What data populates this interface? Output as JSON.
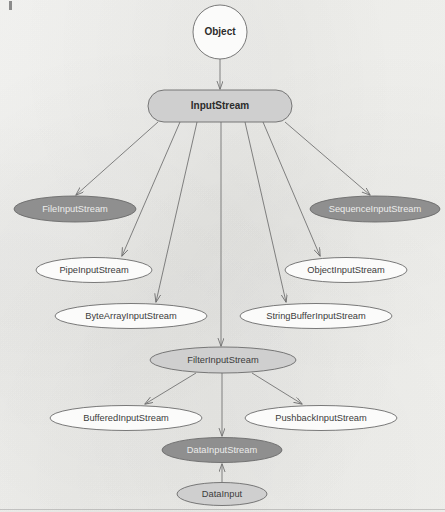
{
  "diagram": {
    "type": "class-hierarchy",
    "width": 445,
    "height": 512,
    "background_color": "#f4f4f1",
    "colors": {
      "dark_fill": "#8f8f8f",
      "light_fill": "#cfcfcf",
      "white_fill": "#fbfbfa",
      "stroke": "#6b6b6b",
      "edge": "#6d6d6d",
      "dark_text": "#3c3c3c",
      "light_text": "#ececeb"
    },
    "nodes": [
      {
        "id": "object",
        "label": "Object",
        "shape": "circle",
        "cx": 220,
        "cy": 32,
        "rx": 27,
        "ry": 27,
        "fill": "white",
        "text": "dark",
        "bold": true
      },
      {
        "id": "input-stream",
        "label": "InputStream",
        "shape": "stadium",
        "cx": 220,
        "cy": 106,
        "rx": 72,
        "ry": 16,
        "fill": "light",
        "text": "dark",
        "bold": true
      },
      {
        "id": "file-input-stream",
        "label": "FileInputStream",
        "shape": "ellipse",
        "cx": 75,
        "cy": 209,
        "rx": 61,
        "ry": 13,
        "fill": "dark",
        "text": "light",
        "bold": false
      },
      {
        "id": "sequence-input-stream",
        "label": "SequenceInputStream",
        "shape": "ellipse",
        "cx": 375,
        "cy": 209,
        "rx": 65,
        "ry": 13,
        "fill": "dark",
        "text": "light",
        "bold": false
      },
      {
        "id": "pipe-input-stream",
        "label": "PipeInputStream",
        "shape": "ellipse",
        "cx": 94,
        "cy": 270,
        "rx": 58,
        "ry": 12.5,
        "fill": "white",
        "text": "dark",
        "bold": false
      },
      {
        "id": "object-input-stream",
        "label": "ObjectInputStream",
        "shape": "ellipse",
        "cx": 346,
        "cy": 270,
        "rx": 61,
        "ry": 12.5,
        "fill": "white",
        "text": "dark",
        "bold": false
      },
      {
        "id": "byte-array-input-stream",
        "label": "ByteArrayInputStream",
        "shape": "ellipse",
        "cx": 131,
        "cy": 316,
        "rx": 76,
        "ry": 12.5,
        "fill": "white",
        "text": "dark",
        "bold": false
      },
      {
        "id": "string-buffer-input-stream",
        "label": "StringBufferInputStream",
        "shape": "ellipse",
        "cx": 316,
        "cy": 316,
        "rx": 76,
        "ry": 12.5,
        "fill": "white",
        "text": "dark",
        "bold": false
      },
      {
        "id": "filter-input-stream",
        "label": "FilterInputStream",
        "shape": "ellipse",
        "cx": 223,
        "cy": 360,
        "rx": 73,
        "ry": 13,
        "fill": "light",
        "text": "dark",
        "bold": false
      },
      {
        "id": "buffered-input-stream",
        "label": "BufferedInputStream",
        "shape": "ellipse",
        "cx": 126,
        "cy": 418,
        "rx": 76,
        "ry": 12.5,
        "fill": "white",
        "text": "dark",
        "bold": false
      },
      {
        "id": "pushback-input-stream",
        "label": "PushbackInputStream",
        "shape": "ellipse",
        "cx": 321,
        "cy": 418,
        "rx": 76,
        "ry": 12.5,
        "fill": "white",
        "text": "dark",
        "bold": false
      },
      {
        "id": "data-input-stream",
        "label": "DataInputStream",
        "shape": "ellipse",
        "cx": 222,
        "cy": 450,
        "rx": 60,
        "ry": 12.5,
        "fill": "dark",
        "text": "light",
        "bold": false
      },
      {
        "id": "data-input",
        "label": "DataInput",
        "shape": "ellipse",
        "cx": 222,
        "cy": 494,
        "rx": 45,
        "ry": 11.5,
        "fill": "light",
        "text": "dark",
        "bold": false
      }
    ],
    "edges": [
      {
        "id": "object-to-input-stream",
        "from": "object",
        "to": "input-stream",
        "x1": 220,
        "y1": 59,
        "x2": 220,
        "y2": 89
      },
      {
        "id": "input-stream-to-file-input-stream",
        "from": "input-stream",
        "to": "file-input-stream",
        "x1": 158,
        "y1": 122,
        "x2": 76,
        "y2": 195
      },
      {
        "id": "input-stream-to-pipe-input-stream",
        "from": "input-stream",
        "to": "pipe-input-stream",
        "x1": 180,
        "y1": 122,
        "x2": 122,
        "y2": 256
      },
      {
        "id": "input-stream-to-byte-array-input-stream",
        "from": "input-stream",
        "to": "byte-array-input-stream",
        "x1": 197,
        "y1": 122,
        "x2": 156,
        "y2": 302
      },
      {
        "id": "input-stream-to-filter-input-stream",
        "from": "input-stream",
        "to": "filter-input-stream",
        "x1": 221,
        "y1": 122,
        "x2": 221,
        "y2": 346
      },
      {
        "id": "input-stream-to-string-buffer-input-stream",
        "from": "input-stream",
        "to": "string-buffer-input-stream",
        "x1": 245,
        "y1": 122,
        "x2": 286,
        "y2": 302
      },
      {
        "id": "input-stream-to-object-input-stream",
        "from": "input-stream",
        "to": "object-input-stream",
        "x1": 263,
        "y1": 122,
        "x2": 320,
        "y2": 256
      },
      {
        "id": "input-stream-to-sequence-input-stream",
        "from": "input-stream",
        "to": "sequence-input-stream",
        "x1": 285,
        "y1": 122,
        "x2": 370,
        "y2": 195
      },
      {
        "id": "filter-input-stream-to-buffered-input-stream",
        "from": "filter-input-stream",
        "to": "buffered-input-stream",
        "x1": 196,
        "y1": 373,
        "x2": 145,
        "y2": 404
      },
      {
        "id": "filter-input-stream-to-data-input-stream",
        "from": "filter-input-stream",
        "to": "data-input-stream",
        "x1": 222,
        "y1": 373,
        "x2": 222,
        "y2": 436
      },
      {
        "id": "filter-input-stream-to-pushback-input-stream",
        "from": "filter-input-stream",
        "to": "pushback-input-stream",
        "x1": 252,
        "y1": 373,
        "x2": 302,
        "y2": 404
      },
      {
        "id": "data-input-to-data-input-stream",
        "from": "data-input",
        "to": "data-input-stream",
        "x1": 222,
        "y1": 482,
        "x2": 222,
        "y2": 464
      }
    ]
  }
}
